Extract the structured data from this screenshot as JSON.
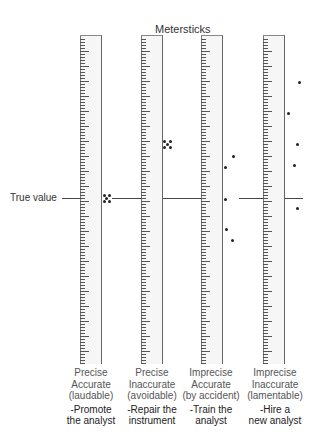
{
  "title": "Metersticks",
  "true_value_label": "True value",
  "rulers": [
    {
      "precision": "Precise",
      "accuracy": "Accurate",
      "verdict": "(laudable)",
      "action_line1": "-Promote",
      "action_line2": "the analyst",
      "left": 80,
      "dots": [
        [
          104,
          195
        ],
        [
          109,
          195
        ],
        [
          106,
          198
        ],
        [
          104,
          201
        ],
        [
          109,
          201
        ]
      ]
    },
    {
      "precision": "Precise",
      "accuracy": "Inaccurate",
      "verdict": "(avoidable)",
      "action_line1": "-Repair the",
      "action_line2": "instrument",
      "left": 141,
      "dots": [
        [
          164,
          141
        ],
        [
          170,
          141
        ],
        [
          167,
          144
        ],
        [
          164,
          147
        ],
        [
          170,
          147
        ]
      ]
    },
    {
      "precision": "Imprecise",
      "accuracy": "Accurate",
      "verdict": "(by accident)",
      "action_line1": "-Train the",
      "action_line2": "analyst",
      "left": 201,
      "dots": [
        [
          233,
          156
        ],
        [
          225,
          167
        ],
        [
          225,
          199
        ],
        [
          226,
          229
        ],
        [
          232,
          240
        ]
      ]
    },
    {
      "precision": "Imprecise",
      "accuracy": "Inaccurate",
      "verdict": "(lamentable)",
      "action_line1": "-Hire a",
      "action_line2": "new analyst",
      "left": 263,
      "dots": [
        [
          299,
          82
        ],
        [
          288,
          113
        ],
        [
          297,
          144
        ],
        [
          294,
          165
        ],
        [
          297,
          208
        ]
      ]
    }
  ],
  "true_value_y": 198,
  "colors": {
    "ruler_fill": "#f6f6f6",
    "ink": "#222222",
    "line": "#444444"
  }
}
